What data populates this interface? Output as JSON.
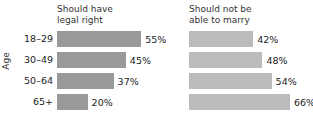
{
  "chart_data": {
    "type": "bar",
    "orientation": "horizontal",
    "title": "",
    "xlabel": "",
    "ylabel": "Age",
    "categories": [
      "18–29",
      "30–49",
      "50–64",
      "65+"
    ],
    "grid": false,
    "legend": "none",
    "xlim": [
      0,
      100
    ],
    "value_suffix": "%",
    "panels": [
      {
        "title": "Should have\nlegal right",
        "title_line1": "Should have",
        "title_line2": "legal right",
        "bar_color": "#999999",
        "values": [
          55,
          45,
          37,
          20
        ],
        "labels": [
          "55%",
          "45%",
          "37%",
          "20%"
        ]
      },
      {
        "title": "Should not be\nable to marry",
        "title_line1": "Should not be",
        "title_line2": "able to marry",
        "bar_color": "#bbbbbb",
        "values": [
          42,
          48,
          54,
          66
        ],
        "labels": [
          "42%",
          "48%",
          "54%",
          "66%"
        ]
      }
    ],
    "series": [
      {
        "name": "Should have legal right",
        "values": [
          55,
          45,
          37,
          20
        ]
      },
      {
        "name": "Should not be able to marry",
        "values": [
          42,
          48,
          54,
          66
        ]
      }
    ]
  },
  "axis": {
    "y_title": "Age"
  },
  "colors": {
    "background": "#ffffff",
    "bar_left": "#999999",
    "bar_right": "#bbbbbb",
    "text": "#222222"
  }
}
